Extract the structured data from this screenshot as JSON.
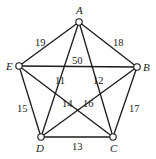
{
  "graph": {
    "vertices": [
      {
        "id": "A",
        "label": "A",
        "x": 79,
        "y": 22,
        "lx": 76,
        "ly": 14
      },
      {
        "id": "B",
        "label": "B",
        "x": 137,
        "y": 67,
        "lx": 143,
        "ly": 71
      },
      {
        "id": "C",
        "label": "C",
        "x": 113,
        "y": 137,
        "lx": 110,
        "ly": 152
      },
      {
        "id": "D",
        "label": "D",
        "x": 41,
        "y": 137,
        "lx": 36,
        "ly": 152
      },
      {
        "id": "E",
        "label": "E",
        "x": 19,
        "y": 66,
        "lx": 6,
        "ly": 70
      }
    ],
    "edges": [
      {
        "from": "A",
        "to": "E",
        "weight": "19",
        "lx": 35,
        "ly": 46
      },
      {
        "from": "A",
        "to": "B",
        "weight": "18",
        "lx": 113,
        "ly": 46
      },
      {
        "from": "E",
        "to": "B",
        "weight": "50",
        "lx": 72,
        "ly": 64
      },
      {
        "from": "A",
        "to": "D",
        "weight": "11",
        "lx": 55,
        "ly": 84
      },
      {
        "from": "A",
        "to": "C",
        "weight": "12",
        "lx": 93,
        "ly": 84
      },
      {
        "from": "E",
        "to": "D",
        "weight": "15",
        "lx": 17,
        "ly": 112
      },
      {
        "from": "B",
        "to": "C",
        "weight": "17",
        "lx": 129,
        "ly": 112
      },
      {
        "from": "E",
        "to": "C",
        "weight": "14",
        "lx": 62,
        "ly": 107
      },
      {
        "from": "B",
        "to": "D",
        "weight": "16",
        "lx": 83,
        "ly": 107
      },
      {
        "from": "D",
        "to": "C",
        "weight": "13",
        "lx": 72,
        "ly": 150
      }
    ]
  }
}
